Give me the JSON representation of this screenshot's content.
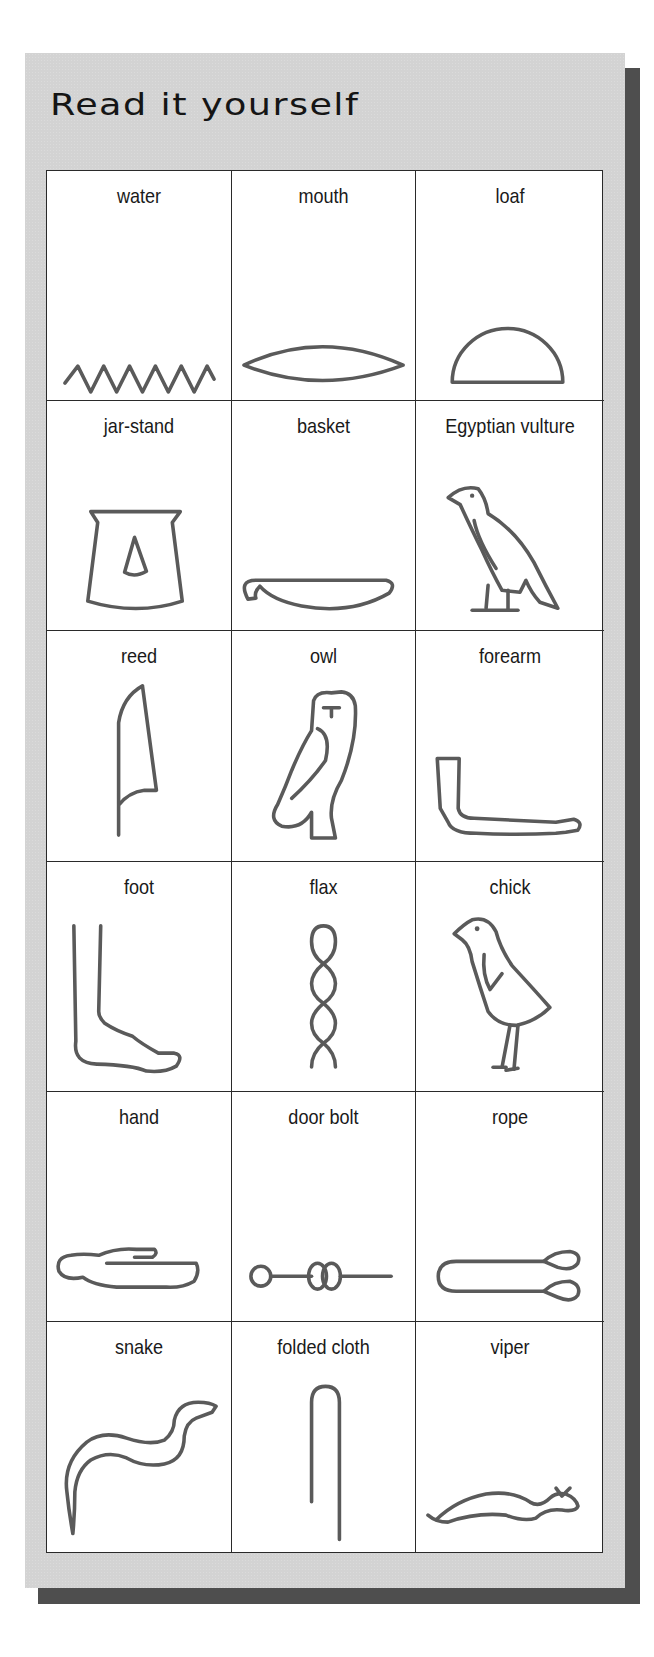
{
  "page": {
    "background": "#ffffff",
    "panel_color": "#d3d3d3",
    "shadow_color": "#4e4e4e",
    "glyph_stroke_color": "#5a5a5a"
  },
  "panel": {
    "title": "Read it yourself"
  },
  "grid": {
    "columns": 3,
    "rows": 6,
    "cells": [
      {
        "label": "water",
        "icon": "water-icon"
      },
      {
        "label": "mouth",
        "icon": "mouth-icon"
      },
      {
        "label": "loaf",
        "icon": "loaf-icon"
      },
      {
        "label": "jar-stand",
        "icon": "jar-stand-icon"
      },
      {
        "label": "basket",
        "icon": "basket-icon"
      },
      {
        "label": "Egyptian vulture",
        "icon": "vulture-icon"
      },
      {
        "label": "reed",
        "icon": "reed-icon"
      },
      {
        "label": "owl",
        "icon": "owl-icon"
      },
      {
        "label": "forearm",
        "icon": "forearm-icon"
      },
      {
        "label": "foot",
        "icon": "foot-icon"
      },
      {
        "label": "flax",
        "icon": "flax-icon"
      },
      {
        "label": "chick",
        "icon": "chick-icon"
      },
      {
        "label": "hand",
        "icon": "hand-icon"
      },
      {
        "label": "door bolt",
        "icon": "door-bolt-icon"
      },
      {
        "label": "rope",
        "icon": "rope-icon"
      },
      {
        "label": "snake",
        "icon": "snake-icon"
      },
      {
        "label": "folded cloth",
        "icon": "folded-cloth-icon"
      },
      {
        "label": "viper",
        "icon": "viper-icon"
      }
    ]
  }
}
